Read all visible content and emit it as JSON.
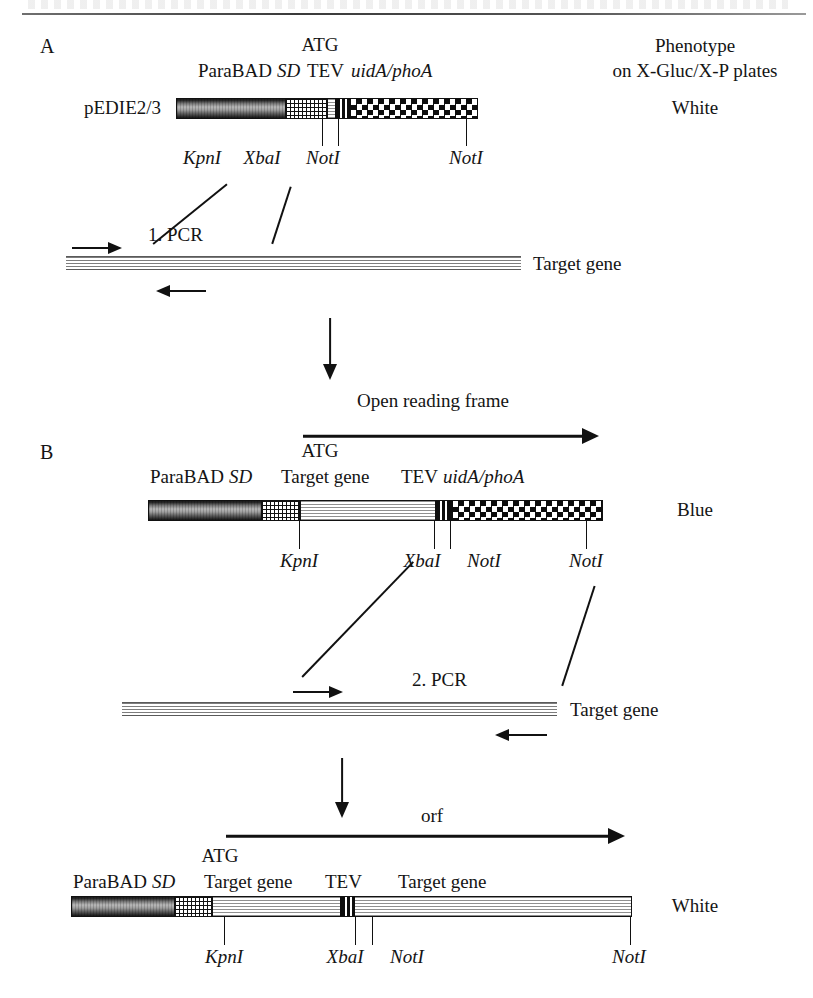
{
  "figure": {
    "title_rule": "horizontal-rule",
    "panels": [
      "A",
      "B"
    ]
  },
  "panelA": {
    "letter": "A",
    "atg": "ATG",
    "promoter": "P",
    "promoter_italic": "araBAD",
    "sd": "SD",
    "tev": "TEV",
    "reporter": "uidA/phoA",
    "plasmid_name": "pEDIE2/3",
    "sites": [
      {
        "label": "KpnI"
      },
      {
        "label": "XbaI"
      },
      {
        "label": "NotI"
      },
      {
        "label": "NotI"
      }
    ]
  },
  "phenotype": {
    "heading_line1": "Phenotype",
    "heading_line2": "on X-Gluc/X-P plates",
    "value_a": "White",
    "value_b": "Blue",
    "value_c": "White"
  },
  "pcr1": {
    "label": "1. PCR",
    "template_label": "Target gene"
  },
  "pcr2": {
    "label": "2. PCR",
    "template_label": "Target gene"
  },
  "orf_top": {
    "label": "Open reading frame"
  },
  "orf_bottom": {
    "label": "orf"
  },
  "panelB": {
    "letter": "B",
    "atg": "ATG",
    "promoter": "P",
    "promoter_italic": "araBAD",
    "sd": "SD",
    "target": "Target gene",
    "tev": "TEV",
    "reporter": "uidA/phoA",
    "sites": [
      {
        "label": "KpnI"
      },
      {
        "label": "XbaI"
      },
      {
        "label": "NotI"
      },
      {
        "label": "NotI"
      }
    ]
  },
  "panelC": {
    "atg": "ATG",
    "promoter": "P",
    "promoter_italic": "araBAD",
    "sd": "SD",
    "target1": "Target gene",
    "tev": "TEV",
    "target2": "Target gene",
    "sites": [
      {
        "label": "KpnI"
      },
      {
        "label": "XbaI"
      },
      {
        "label": "NotI"
      },
      {
        "label": "NotI"
      }
    ]
  },
  "colors": {
    "ink": "#111111",
    "rule": "#555555"
  }
}
